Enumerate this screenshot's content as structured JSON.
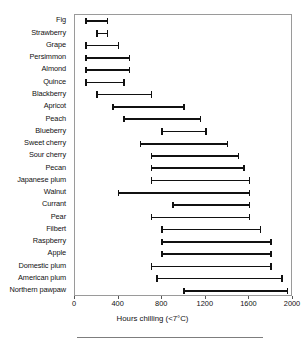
{
  "chart_data": {
    "type": "bar",
    "subtype": "range-bar-horizontal",
    "title": "",
    "subtitle": "",
    "xlabel": "Hours chilling (<7°C)",
    "ylabel": "",
    "xlim": [
      0,
      2000
    ],
    "xticks": [
      0,
      400,
      800,
      1200,
      1600,
      2000
    ],
    "xtick_labels": [
      "0",
      "400",
      "800",
      "1200",
      "1600",
      "2000"
    ],
    "grid": false,
    "legend": null,
    "orientation": "horizontal",
    "value_unit": "hours",
    "categories": [
      "Fig",
      "Strawberry",
      "Grape",
      "Persimmon",
      "Almond",
      "Quince",
      "Blackberry",
      "Apricot",
      "Peach",
      "Blueberry",
      "Sweet cherry",
      "Sour cherry",
      "Pecan",
      "Japanese plum",
      "Walnut",
      "Currant",
      "Pear",
      "Filbert",
      "Raspberry",
      "Apple",
      "Domestic plum",
      "American plum",
      "Northern pawpaw"
    ],
    "ranges": [
      {
        "label": "Fig",
        "low": 100,
        "high": 300
      },
      {
        "label": "Strawberry",
        "low": 200,
        "high": 300
      },
      {
        "label": "Grape",
        "low": 100,
        "high": 400
      },
      {
        "label": "Persimmon",
        "low": 100,
        "high": 500
      },
      {
        "label": "Almond",
        "low": 100,
        "high": 500
      },
      {
        "label": "Quince",
        "low": 100,
        "high": 450
      },
      {
        "label": "Blackberry",
        "low": 200,
        "high": 700
      },
      {
        "label": "Apricot",
        "low": 350,
        "high": 1000
      },
      {
        "label": "Peach",
        "low": 450,
        "high": 1150
      },
      {
        "label": "Blueberry",
        "low": 800,
        "high": 1200
      },
      {
        "label": "Sweet cherry",
        "low": 600,
        "high": 1400
      },
      {
        "label": "Sour cherry",
        "low": 700,
        "high": 1500
      },
      {
        "label": "Pecan",
        "low": 700,
        "high": 1550
      },
      {
        "label": "Japanese plum",
        "low": 700,
        "high": 1600
      },
      {
        "label": "Walnut",
        "low": 400,
        "high": 1600
      },
      {
        "label": "Currant",
        "low": 900,
        "high": 1600
      },
      {
        "label": "Pear",
        "low": 700,
        "high": 1600
      },
      {
        "label": "Filbert",
        "low": 800,
        "high": 1700
      },
      {
        "label": "Raspberry",
        "low": 800,
        "high": 1800
      },
      {
        "label": "Apple",
        "low": 800,
        "high": 1800
      },
      {
        "label": "Domestic plum",
        "low": 700,
        "high": 1800
      },
      {
        "label": "American plum",
        "low": 750,
        "high": 1900
      },
      {
        "label": "Northern pawpaw",
        "low": 1000,
        "high": 1950
      }
    ],
    "colors": {
      "bar": "#111111",
      "axis": "#9a9a9a",
      "text": "#111111",
      "background": "#ffffff"
    }
  }
}
